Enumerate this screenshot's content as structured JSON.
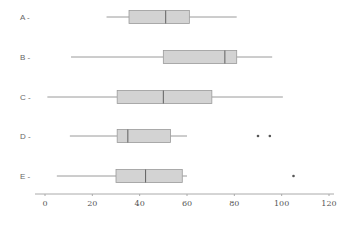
{
  "chart_data": {
    "type": "boxplot",
    "orientation": "horizontal",
    "title": "",
    "xlabel": "",
    "ylabel": "",
    "xlim": [
      -5,
      122
    ],
    "xticks": [
      0,
      20,
      40,
      60,
      80,
      100,
      120
    ],
    "xtick_labels": [
      "0",
      "20",
      "40",
      "60",
      "80",
      "100",
      "120"
    ],
    "grid": false,
    "legend": "none",
    "categories": [
      "A",
      "B",
      "C",
      "D",
      "E"
    ],
    "category_labels": [
      "A -",
      "B -",
      "C -",
      "D -",
      "E -"
    ],
    "boxes": [
      {
        "name": "A",
        "whisker_low": 26,
        "q1": 35.5,
        "median": 51,
        "q3": 61,
        "whisker_high": 81,
        "outliers": []
      },
      {
        "name": "B",
        "whisker_low": 11,
        "q1": 50,
        "median": 76,
        "q3": 81,
        "whisker_high": 96,
        "outliers": []
      },
      {
        "name": "C",
        "whisker_low": 1,
        "q1": 30.5,
        "median": 50,
        "q3": 70.5,
        "whisker_high": 100.5,
        "outliers": []
      },
      {
        "name": "D",
        "whisker_low": 10.5,
        "q1": 30.5,
        "median": 35,
        "q3": 53,
        "whisker_high": 60,
        "outliers": [
          90,
          95
        ]
      },
      {
        "name": "E",
        "whisker_low": 5,
        "q1": 30,
        "median": 42.5,
        "q3": 58,
        "whisker_high": 60,
        "outliers": [
          105
        ]
      }
    ],
    "colors": {
      "box_fill": "#d3d3d3",
      "box_stroke": "#9a9a9a",
      "median": "#606060",
      "whisker": "#9a9a9a",
      "axis": "#aaaaaa",
      "outlier": "#555555"
    }
  }
}
